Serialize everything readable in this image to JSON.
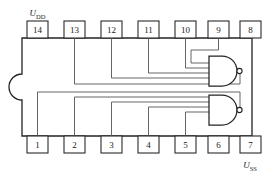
{
  "diagram": {
    "component_type": "dual 4-input NAND gate IC",
    "package": {
      "name": "dip-14-package",
      "pin_count": 14,
      "notch_side": "left",
      "outline_color": "#232323",
      "fill_color": "#ffffff"
    },
    "power_labels": {
      "positive": {
        "name": "supply-positive",
        "symbol": "U",
        "subscript": "DD",
        "pin": "14",
        "position": "top-left"
      },
      "negative": {
        "name": "supply-negative",
        "symbol": "U",
        "subscript": "SS",
        "pin": "7",
        "position": "bottom-right"
      }
    },
    "pins_top": [
      {
        "number": "14",
        "name": "pin-14"
      },
      {
        "number": "13",
        "name": "pin-13"
      },
      {
        "number": "12",
        "name": "pin-12"
      },
      {
        "number": "11",
        "name": "pin-11"
      },
      {
        "number": "10",
        "name": "pin-10"
      },
      {
        "number": "9",
        "name": "pin-9"
      },
      {
        "number": "8",
        "name": "pin-8"
      }
    ],
    "pins_bottom": [
      {
        "number": "1",
        "name": "pin-1"
      },
      {
        "number": "2",
        "name": "pin-2"
      },
      {
        "number": "3",
        "name": "pin-3"
      },
      {
        "number": "4",
        "name": "pin-4"
      },
      {
        "number": "5",
        "name": "pin-5"
      },
      {
        "number": "6",
        "name": "pin-6"
      },
      {
        "number": "7",
        "name": "pin-7"
      }
    ],
    "gates": [
      {
        "name": "nand-gate-upper",
        "type": "NAND",
        "input_count": 4,
        "inputs": [
          "13",
          "12",
          "11",
          "10"
        ],
        "output": "9",
        "bubble": true
      },
      {
        "name": "nand-gate-lower",
        "type": "NAND",
        "input_count": 4,
        "inputs": [
          "1",
          "2",
          "3",
          "4"
        ],
        "output": "5",
        "bubble": true
      }
    ],
    "wire_color": "#555555"
  }
}
